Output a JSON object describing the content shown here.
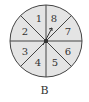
{
  "diagram": {
    "type": "spinner",
    "caption": "B",
    "sector_count": 8,
    "sectors": [
      {
        "label": "1"
      },
      {
        "label": "2"
      },
      {
        "label": "3"
      },
      {
        "label": "4"
      },
      {
        "label": "5"
      },
      {
        "label": "6"
      },
      {
        "label": "7"
      },
      {
        "label": "8"
      }
    ],
    "colors": {
      "fill": "#e4e4e4",
      "stroke": "#444444"
    }
  }
}
